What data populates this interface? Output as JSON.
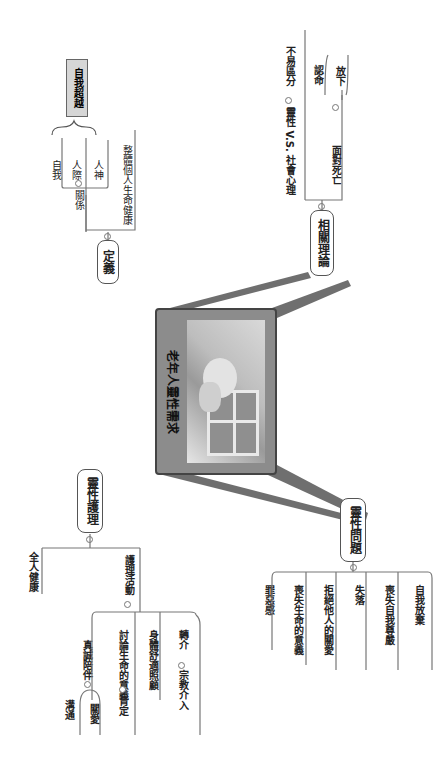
{
  "central_topic": {
    "title": "老年人靈性需求",
    "image": "elderly-person-photo"
  },
  "branches": {
    "definition": {
      "label": "定義",
      "children": {
        "relation": "關係",
        "relation_items": [
          "自我",
          "人際",
          "人神"
        ],
        "self_transcendence": "自我超越",
        "holistic": "整體個人生命健康"
      }
    },
    "theories": {
      "label": "相關理論",
      "children": {
        "spirit_vs_social": "靈性 V.S. 社會心理",
        "hard_to_distinguish": "不易區分",
        "facing_death": "面對死亡",
        "death_items": [
          "認命",
          "放下"
        ]
      }
    },
    "care": {
      "label": "靈性護理",
      "children": {
        "whole_person": "全人健康",
        "activities": "護理活動",
        "genuine_company": "真誠陪伴",
        "company_items": [
          "溝通",
          "關愛"
        ],
        "affirm": "肯定",
        "discuss_meaning": "討論生命的意義",
        "comfort": "身體舒適照顧",
        "religion": "宗教介入",
        "referral": "轉介"
      }
    },
    "problems": {
      "label": "靈性問題",
      "children": [
        "罪惡感",
        "喪失生命的意義",
        "拒絕他人的關愛",
        "失落",
        "喪失自我尊嚴",
        "自我放棄"
      ]
    }
  },
  "colors": {
    "connector": "#6f6f6f",
    "center_fill": "#8c8c8c",
    "node_border": "#555555",
    "highlight_fill": "#d6d6d6"
  }
}
